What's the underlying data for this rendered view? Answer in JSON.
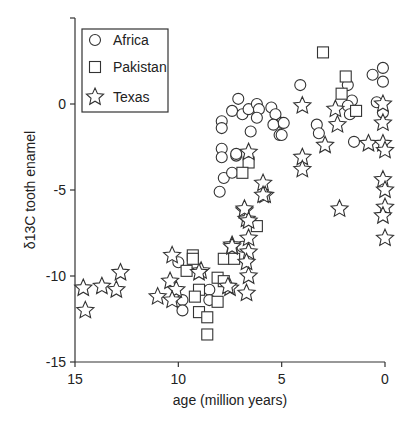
{
  "chart_data": {
    "type": "scatter",
    "title": "",
    "xlabel": "age (million years)",
    "ylabel": "δ13C tooth enamel",
    "xlim": [
      15,
      0
    ],
    "ylim": [
      -15,
      5
    ],
    "x_inverted": true,
    "x_ticks": [
      15,
      10,
      5,
      0
    ],
    "x_tick_labels": [
      "15",
      "10",
      "5",
      "0"
    ],
    "y_ticks": [
      0,
      -5,
      -10,
      -15
    ],
    "y_tick_labels": [
      "0",
      "-5",
      "-10",
      "-15"
    ],
    "grid": false,
    "legend_position": "upper-left",
    "legend": [
      "Africa",
      "Pakistan",
      "Texas"
    ],
    "series": [
      {
        "name": "Africa",
        "marker": "circle",
        "points": [
          [
            7.1,
            0.3
          ],
          [
            7.4,
            -0.4
          ],
          [
            6.9,
            -0.6
          ],
          [
            6.6,
            -0.3
          ],
          [
            6.2,
            0.0
          ],
          [
            6.1,
            -0.3
          ],
          [
            6.2,
            -0.8
          ],
          [
            5.5,
            -0.2
          ],
          [
            5.3,
            -0.6
          ],
          [
            5.0,
            -1.1
          ],
          [
            5.4,
            -1.2
          ],
          [
            5.1,
            -1.8
          ],
          [
            7.9,
            -1.0
          ],
          [
            7.9,
            -1.4
          ],
          [
            6.5,
            -1.6
          ],
          [
            7.9,
            -2.6
          ],
          [
            7.9,
            -3.1
          ],
          [
            7.2,
            -3.0
          ],
          [
            7.8,
            -4.3
          ],
          [
            7.4,
            -4.0
          ],
          [
            8.0,
            -5.1
          ],
          [
            7.2,
            -2.9
          ],
          [
            4.1,
            1.1
          ],
          [
            0.1,
            2.1
          ],
          [
            0.1,
            1.3
          ],
          [
            0.6,
            1.7
          ],
          [
            1.8,
            1.1
          ],
          [
            1.6,
            0.2
          ],
          [
            1.8,
            -0.1
          ],
          [
            1.7,
            -0.6
          ],
          [
            0.4,
            0.1
          ],
          [
            0.1,
            -0.5
          ],
          [
            3.3,
            -1.2
          ],
          [
            3.2,
            -1.7
          ],
          [
            4.9,
            -1.1
          ],
          [
            5.0,
            -1.8
          ],
          [
            1.5,
            -2.2
          ],
          [
            6.9,
            -8.3
          ],
          [
            8.5,
            -10.8
          ],
          [
            8.5,
            -11.4
          ],
          [
            10.0,
            -9.2
          ],
          [
            9.8,
            -11.4
          ],
          [
            9.8,
            -12.0
          ]
        ]
      },
      {
        "name": "Pakistan",
        "marker": "square",
        "points": [
          [
            3.0,
            3.0
          ],
          [
            1.9,
            1.6
          ],
          [
            2.1,
            0.6
          ],
          [
            1.4,
            -0.4
          ],
          [
            6.6,
            -3.4
          ],
          [
            6.9,
            -4.0
          ],
          [
            6.2,
            -7.1
          ],
          [
            7.8,
            -9.0
          ],
          [
            7.3,
            -9.0
          ],
          [
            8.1,
            -10.1
          ],
          [
            7.8,
            -10.3
          ],
          [
            8.1,
            -11.5
          ],
          [
            9.3,
            -8.8
          ],
          [
            9.3,
            -9.0
          ],
          [
            9.6,
            -9.7
          ],
          [
            9.0,
            -10.8
          ],
          [
            9.2,
            -11.2
          ],
          [
            9.0,
            -12.1
          ],
          [
            8.6,
            -12.4
          ],
          [
            8.6,
            -13.4
          ]
        ]
      },
      {
        "name": "Texas",
        "marker": "star",
        "points": [
          [
            4.0,
            -0.1
          ],
          [
            2.4,
            -0.3
          ],
          [
            2.3,
            -1.2
          ],
          [
            2.9,
            -2.4
          ],
          [
            0.8,
            -2.3
          ],
          [
            0.1,
            -2.3
          ],
          [
            0.1,
            -1.1
          ],
          [
            0.1,
            0.0
          ],
          [
            0.0,
            -2.7
          ],
          [
            4.0,
            -3.1
          ],
          [
            4.0,
            -3.8
          ],
          [
            2.2,
            -6.1
          ],
          [
            0.1,
            -4.4
          ],
          [
            0.0,
            -5.0
          ],
          [
            0.0,
            -6.0
          ],
          [
            0.1,
            -6.5
          ],
          [
            0.0,
            -7.8
          ],
          [
            6.6,
            -2.8
          ],
          [
            5.9,
            -4.6
          ],
          [
            5.8,
            -5.3
          ],
          [
            5.9,
            -5.3
          ],
          [
            6.8,
            -6.2
          ],
          [
            6.7,
            -6.7
          ],
          [
            6.8,
            -6.1
          ],
          [
            6.6,
            -6.8
          ],
          [
            6.6,
            -7.8
          ],
          [
            7.4,
            -8.2
          ],
          [
            7.4,
            -8.3
          ],
          [
            6.6,
            -8.6
          ],
          [
            6.7,
            -9.2
          ],
          [
            6.6,
            -10.0
          ],
          [
            7.5,
            -10.7
          ],
          [
            7.6,
            -10.6
          ],
          [
            6.7,
            -11.0
          ],
          [
            8.9,
            -9.7
          ],
          [
            9.0,
            -9.8
          ],
          [
            10.3,
            -8.8
          ],
          [
            10.4,
            -10.3
          ],
          [
            10.1,
            -10.8
          ],
          [
            11.0,
            -11.2
          ],
          [
            10.3,
            -11.4
          ],
          [
            12.8,
            -9.8
          ],
          [
            13.7,
            -10.6
          ],
          [
            13.0,
            -10.8
          ],
          [
            14.6,
            -10.7
          ],
          [
            14.5,
            -12.0
          ]
        ]
      }
    ]
  }
}
